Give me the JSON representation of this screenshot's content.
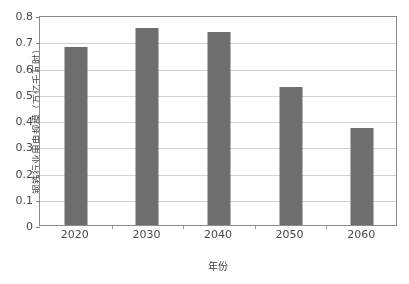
{
  "chart_data": {
    "type": "bar",
    "title": "",
    "subtitle": "",
    "xlabel": "年份",
    "ylabel": "钢铁行业用电规模（万亿千瓦时）",
    "categories": [
      "2020",
      "2030",
      "2040",
      "2050",
      "2060"
    ],
    "values": [
      0.68,
      0.752,
      0.737,
      0.525,
      0.37
    ],
    "series": [
      {
        "name": "钢铁行业用电规模",
        "values": [
          0.68,
          0.752,
          0.737,
          0.525,
          0.37
        ]
      }
    ],
    "ylim": [
      0,
      0.8
    ],
    "ytick_labels": [
      "0",
      "0.1",
      "0.2",
      "0.3",
      "0.4",
      "0.5",
      "0.6",
      "0.7",
      "0.8"
    ],
    "ytick_values": [
      0,
      0.1,
      0.2,
      0.3,
      0.4,
      0.5,
      0.6,
      0.7,
      0.8
    ],
    "xtick_labels": [
      "2020",
      "2030",
      "2040",
      "2050",
      "2060"
    ],
    "grid": "horizontal",
    "legend": "none",
    "annotations": [],
    "colors": {
      "bar": "#6e6e6e",
      "gridline": "#d2d2d2",
      "axis_border": "#8b8b8b",
      "text": "#4a4a4a",
      "background": "#ffffff"
    }
  }
}
